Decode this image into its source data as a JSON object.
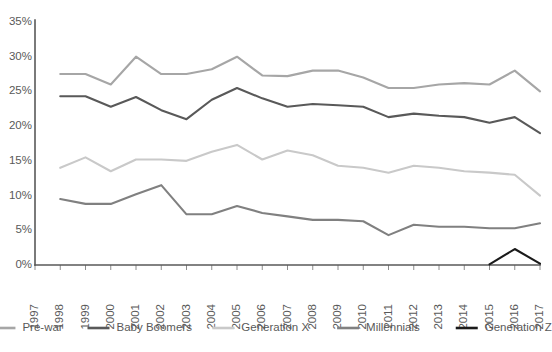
{
  "chart_data": {
    "type": "line",
    "title": "",
    "subtitle": "",
    "xlabel": "",
    "ylabel": "",
    "grid": false,
    "legend_position": "bottom",
    "x": [
      1997,
      1998,
      1999,
      2000,
      2001,
      2002,
      2003,
      2004,
      2005,
      2006,
      2007,
      2008,
      2009,
      2010,
      2011,
      2012,
      2013,
      2014,
      2015,
      2016,
      2017
    ],
    "xtick_labels": [
      "1997",
      "1998",
      "1999",
      "2000",
      "2001",
      "2002",
      "2003",
      "2004",
      "2005",
      "2006",
      "2007",
      "2008",
      "2009",
      "2010",
      "2011",
      "2012",
      "2013",
      "2014",
      "2015",
      "2016",
      "2017"
    ],
    "ytick_labels": [
      "35%",
      "30%",
      "25%",
      "20%",
      "15%",
      "10%",
      "5%",
      "0%"
    ],
    "ytick_values": [
      35,
      30,
      25,
      20,
      15,
      10,
      5,
      0
    ],
    "ylim": [
      0,
      35
    ],
    "xlim": [
      1997,
      2017
    ],
    "series": [
      {
        "name": "Pre-war",
        "color": "#a6a6a6",
        "start_year": 1998,
        "values": [
          null,
          27.5,
          27.5,
          26.0,
          30.0,
          27.5,
          27.5,
          28.2,
          30.0,
          27.3,
          27.2,
          28.0,
          28.0,
          27.0,
          25.5,
          25.5,
          26.0,
          26.2,
          26.0,
          28.0,
          25.0
        ]
      },
      {
        "name": "Baby Boomers",
        "color": "#595959",
        "start_year": 1998,
        "values": [
          null,
          24.3,
          24.3,
          22.8,
          24.2,
          22.3,
          21.0,
          23.8,
          25.5,
          24.0,
          22.8,
          23.2,
          23.0,
          22.8,
          21.3,
          21.8,
          21.5,
          21.3,
          20.5,
          21.3,
          19.0
        ]
      },
      {
        "name": "Generation X",
        "color": "#c9c9c9",
        "start_year": 1998,
        "values": [
          null,
          14.0,
          15.5,
          13.5,
          15.2,
          15.2,
          15.0,
          16.3,
          17.3,
          15.2,
          16.5,
          15.8,
          14.3,
          14.0,
          13.3,
          14.3,
          14.0,
          13.5,
          13.3,
          13.0,
          10.0
        ]
      },
      {
        "name": "Millennials",
        "color": "#808080",
        "start_year": 1998,
        "values": [
          null,
          9.5,
          8.8,
          8.8,
          10.2,
          11.5,
          7.3,
          7.3,
          8.5,
          7.5,
          7.0,
          6.5,
          6.5,
          6.3,
          4.3,
          5.8,
          5.5,
          5.5,
          5.3,
          5.3,
          6.0
        ]
      },
      {
        "name": "Generation Z",
        "color": "#1a1a1a",
        "start_year": 2015,
        "values": [
          null,
          null,
          null,
          null,
          null,
          null,
          null,
          null,
          null,
          null,
          null,
          null,
          null,
          null,
          null,
          null,
          null,
          null,
          0.1,
          2.3,
          0.2
        ]
      }
    ]
  },
  "legend": {
    "items": [
      {
        "label": "Pre-war",
        "color": "#a6a6a6"
      },
      {
        "label": "Baby Boomers",
        "color": "#595959"
      },
      {
        "label": "Generation X",
        "color": "#c9c9c9"
      },
      {
        "label": "Millennials",
        "color": "#808080"
      },
      {
        "label": "Generation Z",
        "color": "#1a1a1a"
      }
    ]
  }
}
